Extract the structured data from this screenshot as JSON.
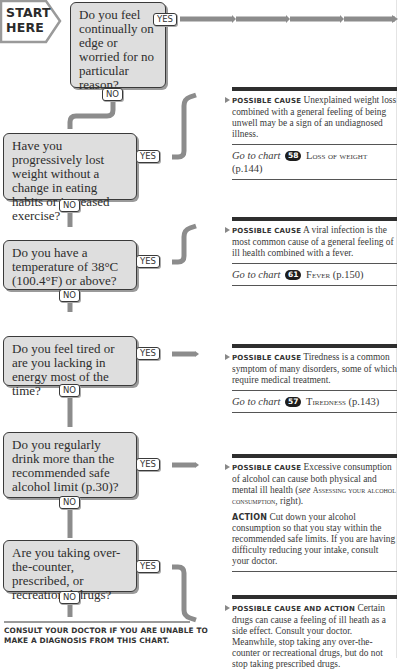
{
  "start": {
    "line1": "START",
    "line2": "HERE"
  },
  "labels": {
    "yes": "YES",
    "no": "NO"
  },
  "questions": [
    {
      "id": "q1",
      "text": "Do you feel continually on edge or worried for no particular reason?"
    },
    {
      "id": "q2",
      "text": "Have you progressively lost weight without a change in eating habits or increased exercise?"
    },
    {
      "id": "q3",
      "text": "Do you have a temperature of 38°C (100.4°F) or above?"
    },
    {
      "id": "q4",
      "text": "Do you feel tired or are you lacking in energy most of the time?"
    },
    {
      "id": "q5",
      "text": "Do you regularly drink more than the recommended safe alcohol limit (p.30)?"
    },
    {
      "id": "q6",
      "text": "Are you taking over-the-counter, prescribed, or recreational drugs?"
    }
  ],
  "outcomes": [
    {
      "heading": "Possible cause",
      "text": "Unexplained weight loss combined with a general feeling of being unwell may be a sign of an undiagnosed illness.",
      "goto": {
        "prefix": "Go to chart",
        "number": "58",
        "title": "Loss of weight",
        "page": "(p.144)"
      }
    },
    {
      "heading": "Possible cause",
      "text": "A viral infection is the most common cause of a general feeling of ill health combined with a fever.",
      "goto": {
        "prefix": "Go to chart",
        "number": "61",
        "title": "Fever",
        "page": "(p.150)"
      }
    },
    {
      "heading": "Possible cause",
      "text": "Tiredness is a common symptom of many disorders, some of which require medical treatment.",
      "goto": {
        "prefix": "Go to chart",
        "number": "57",
        "title": "Tiredness",
        "page": "(p.143)"
      }
    },
    {
      "heading": "Possible cause",
      "text_a": "Excessive consumption of alcohol can cause both physical and mental ill health (",
      "see": "see",
      "ref": "Assessing your alcohol consumption",
      "text_b": ", right).",
      "action_heading": "Action",
      "action_text": "Cut down your alcohol consumption so that you stay within the recommended safe limits. If you are having difficulty reducing your intake, consult your doctor."
    },
    {
      "heading": "Possible cause and action",
      "text": "Certain drugs can cause a feeling of ill heath as a side effect. Consult your doctor. Meanwhile, stop taking any over-the-counter or recreational drugs, but do not stop taking prescribed drugs."
    }
  ],
  "footer": {
    "text": "Consult your doctor if you are unable to make a diagnosis from this chart."
  },
  "colors": {
    "box_fill": "#dedede",
    "connector": "#8c8c8c",
    "ink": "#2a2a2a",
    "rule": "#2e2e2e"
  }
}
